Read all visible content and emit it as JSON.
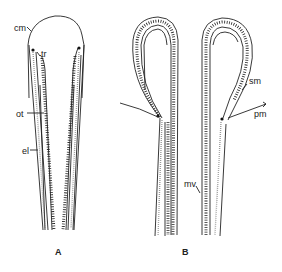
{
  "figure": {
    "panels": [
      {
        "id": "A",
        "label": "A",
        "annotations": [
          {
            "key": "cm",
            "text": "cm"
          },
          {
            "key": "tr",
            "text": "tr"
          },
          {
            "key": "ot",
            "text": "ot"
          },
          {
            "key": "el",
            "text": "el"
          }
        ]
      },
      {
        "id": "B",
        "label": "B",
        "annotations": [
          {
            "key": "sm",
            "text": "sm"
          },
          {
            "key": "pm",
            "text": "pm"
          },
          {
            "key": "mv",
            "text": "mv"
          }
        ]
      }
    ],
    "colors": {
      "line": "#222222",
      "stipple": "#777777",
      "background": "#ffffff"
    }
  }
}
